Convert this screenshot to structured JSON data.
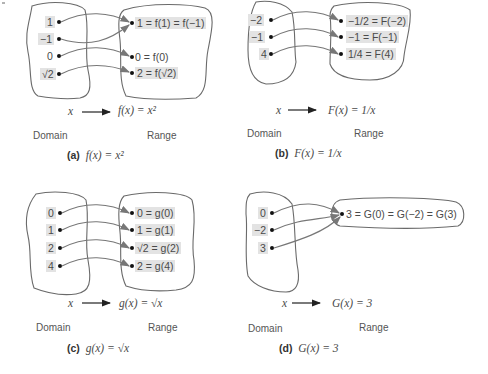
{
  "panels": [
    {
      "id": "a",
      "caption_letter": "(a)",
      "caption_formula": "f(x) = x²",
      "rule": {
        "input": "x",
        "output": "f(x) = x²"
      },
      "domain_label": "Domain",
      "range_label": "Range",
      "domain": [
        "1",
        "−1",
        "0",
        "√2"
      ],
      "range": [
        "1 = f(1) = f(−1)",
        "0 = f(0)",
        "2 = f(√2)"
      ],
      "mapping": [
        [
          "1",
          "1"
        ],
        [
          "−1",
          "1"
        ],
        [
          "0",
          "0"
        ],
        [
          "√2",
          "2"
        ]
      ]
    },
    {
      "id": "b",
      "caption_letter": "(b)",
      "caption_formula": "F(x) = 1/x",
      "rule": {
        "input": "x",
        "output": "F(x) = 1/x"
      },
      "domain_label": "Domain",
      "range_label": "Range",
      "domain": [
        "−2",
        "−1",
        "4"
      ],
      "range": [
        "−1/2 = F(−2)",
        "−1 = F(−1)",
        "1/4 = F(4)"
      ],
      "mapping": [
        [
          "−2",
          "−1/2"
        ],
        [
          "−1",
          "−1"
        ],
        [
          "4",
          "1/4"
        ]
      ]
    },
    {
      "id": "c",
      "caption_letter": "(c)",
      "caption_formula": "g(x) = √x",
      "rule": {
        "input": "x",
        "output": "g(x) = √x"
      },
      "domain_label": "Domain",
      "range_label": "Range",
      "domain": [
        "0",
        "1",
        "2",
        "4"
      ],
      "range": [
        "0 = g(0)",
        "1 = g(1)",
        "√2 = g(2)",
        "2 = g(4)"
      ],
      "mapping": [
        [
          "0",
          "0"
        ],
        [
          "1",
          "1"
        ],
        [
          "2",
          "√2"
        ],
        [
          "4",
          "2"
        ]
      ]
    },
    {
      "id": "d",
      "caption_letter": "(d)",
      "caption_formula": "G(x) = 3",
      "rule": {
        "input": "x",
        "output": "G(x) = 3"
      },
      "domain_label": "Domain",
      "range_label": "Range",
      "domain": [
        "0",
        "−2",
        "3"
      ],
      "range": [
        "3 = G(0) = G(−2) = G(3)"
      ],
      "mapping": [
        [
          "0",
          "3"
        ],
        [
          "−2",
          "3"
        ],
        [
          "3",
          "3"
        ]
      ]
    }
  ],
  "colors": {
    "outline": "#6a6a6a",
    "highlight": "#e3e3e3",
    "text": "#4a4a4a"
  }
}
